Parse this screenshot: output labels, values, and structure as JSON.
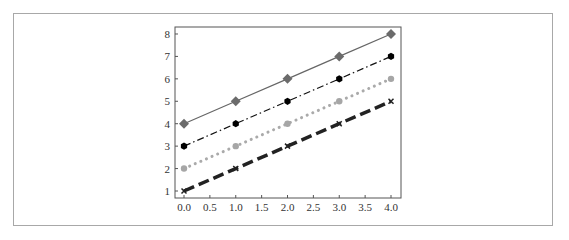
{
  "chart_data": {
    "type": "line",
    "title": "",
    "xlabel": "",
    "ylabel": "",
    "x": [
      0,
      1,
      2,
      3,
      4
    ],
    "xlim": [
      -0.2,
      4.2
    ],
    "ylim": [
      0.7,
      8.3
    ],
    "xticks": [
      "0.0",
      "0.5",
      "1.0",
      "1.5",
      "2.0",
      "2.5",
      "3.0",
      "3.5",
      "4.0"
    ],
    "xtick_values": [
      0,
      0.5,
      1,
      1.5,
      2,
      2.5,
      3,
      3.5,
      4
    ],
    "yticks": [
      "1",
      "2",
      "3",
      "4",
      "5",
      "6",
      "7",
      "8"
    ],
    "ytick_values": [
      1,
      2,
      3,
      4,
      5,
      6,
      7,
      8
    ],
    "grid": false,
    "legend": null,
    "series": [
      {
        "name": "series-1",
        "values": [
          4,
          5,
          6,
          7,
          8
        ],
        "line_style": "solid",
        "marker": "diamond",
        "color": "#666666",
        "marker_color": "#6b6b6b",
        "line_width": 1.2
      },
      {
        "name": "series-2",
        "values": [
          3,
          4,
          5,
          6,
          7
        ],
        "line_style": "dashdot",
        "marker": "hexagon",
        "color": "#111111",
        "marker_color": "#000000",
        "line_width": 1.2
      },
      {
        "name": "series-3",
        "values": [
          2,
          3,
          4,
          5,
          6
        ],
        "line_style": "dotted",
        "marker": "circle",
        "color": "#aaaaaa",
        "marker_color": "#a6a6a6",
        "line_width": 3
      },
      {
        "name": "series-4",
        "values": [
          1,
          2,
          3,
          4,
          5
        ],
        "line_style": "dashed",
        "marker": "x",
        "color": "#222222",
        "marker_color": "#222222",
        "line_width": 3.5
      }
    ]
  },
  "layout": {
    "plot_left": 175,
    "plot_top": 27,
    "plot_right": 401,
    "plot_bottom": 198,
    "x0_px": 184,
    "x_px_per_unit": 51.75,
    "y1_px": 191,
    "y_px_per_unit": 22.43
  }
}
